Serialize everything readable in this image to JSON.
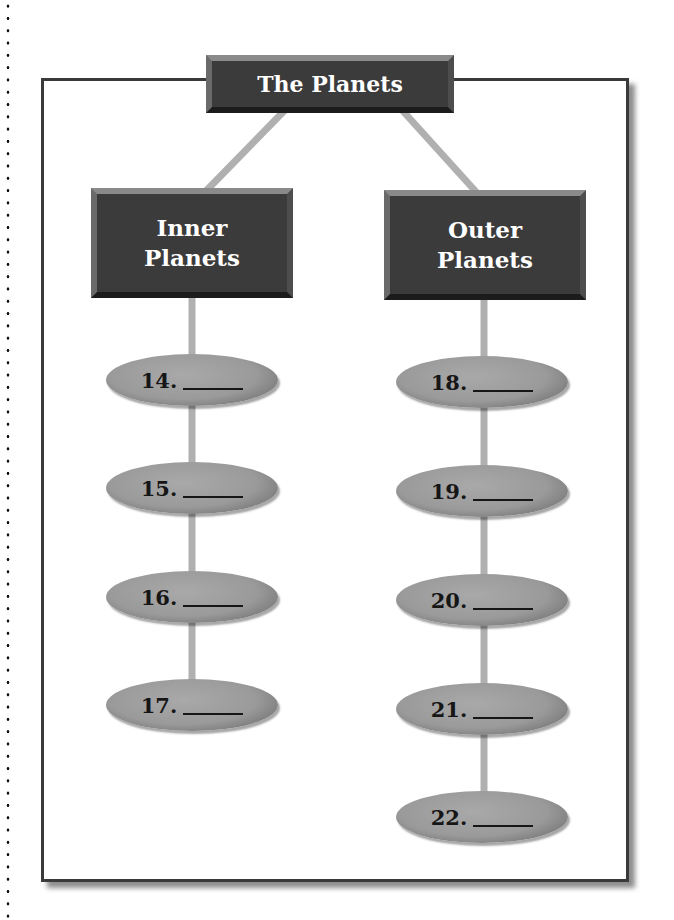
{
  "diagram": {
    "title": "The Planets",
    "categories": [
      {
        "label_line1": "Inner",
        "label_line2": "Planets",
        "items": [
          "14.",
          "15.",
          "16.",
          "17."
        ]
      },
      {
        "label_line1": "Outer",
        "label_line2": "Planets",
        "items": [
          "18.",
          "19.",
          "20.",
          "21.",
          "22."
        ]
      }
    ]
  },
  "colors": {
    "box_fill": "#3b3b3b",
    "box_text": "#ffffff",
    "oval_fill": "#9a9a9a",
    "connector": "#b0b0b0",
    "frame_border": "#3a3a3a"
  }
}
